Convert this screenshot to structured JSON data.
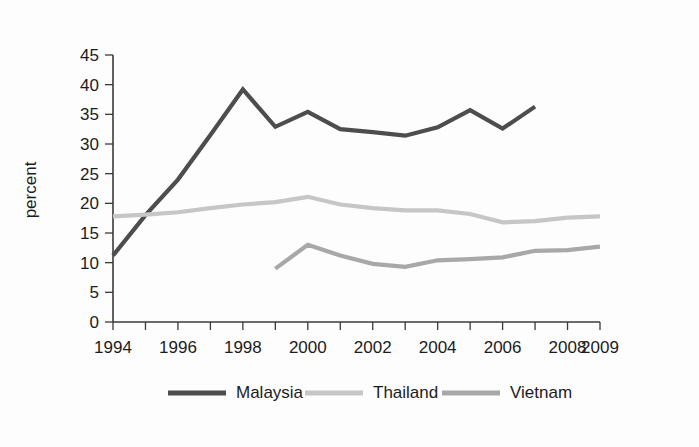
{
  "chart_data": {
    "type": "line",
    "title": "",
    "xlabel": "",
    "ylabel": "percent",
    "xlim": [
      1994,
      2009
    ],
    "ylim": [
      0,
      45
    ],
    "ytick_step": 5,
    "yticks": [
      0,
      5,
      10,
      15,
      20,
      25,
      30,
      35,
      40,
      45
    ],
    "xticks": [
      1994,
      1995,
      1996,
      1997,
      1998,
      1999,
      2000,
      2001,
      2002,
      2003,
      2004,
      2005,
      2006,
      2007,
      2008,
      2009
    ],
    "xtick_labels": [
      "1994",
      "",
      "1996",
      "",
      "1998",
      "",
      "2000",
      "",
      "2002",
      "",
      "2004",
      "",
      "2006",
      "",
      "2008",
      "2009"
    ],
    "grid": false,
    "legend_position": "bottom",
    "series": [
      {
        "name": "Malaysia",
        "color": "#4d4d4d",
        "x": [
          1994,
          1995,
          1996,
          1997,
          1998,
          1999,
          2000,
          2001,
          2002,
          2003,
          2004,
          2005,
          2006,
          2007
        ],
        "values": [
          11.2,
          18.0,
          24.0,
          31.5,
          39.2,
          32.9,
          35.4,
          32.5,
          32.0,
          31.4,
          32.8,
          35.7,
          32.6,
          36.3
        ]
      },
      {
        "name": "Thailand",
        "color": "#c6c6c6",
        "x": [
          1994,
          1995,
          1996,
          1997,
          1998,
          1999,
          2000,
          2001,
          2002,
          2003,
          2004,
          2005,
          2006,
          2007,
          2008,
          2009
        ],
        "values": [
          17.8,
          18.1,
          18.5,
          19.2,
          19.8,
          20.2,
          21.1,
          19.8,
          19.2,
          18.8,
          18.8,
          18.2,
          16.8,
          17.0,
          17.6,
          17.8
        ]
      },
      {
        "name": "Vietnam",
        "color": "#a8a8a8",
        "x": [
          1999,
          2000,
          2001,
          2002,
          2003,
          2004,
          2005,
          2006,
          2007,
          2008,
          2009
        ],
        "values": [
          9.0,
          13.0,
          11.2,
          9.8,
          9.3,
          10.4,
          10.6,
          10.9,
          12.0,
          12.1,
          12.7
        ]
      }
    ],
    "legend": [
      {
        "label": "Malaysia",
        "color": "#4d4d4d"
      },
      {
        "label": "Thailand",
        "color": "#c6c6c6"
      },
      {
        "label": "Vietnam",
        "color": "#a8a8a8"
      }
    ]
  },
  "colors": {
    "axis": "#3a3a3a",
    "text": "#1c1c1c",
    "background": "#fdfdfd"
  }
}
